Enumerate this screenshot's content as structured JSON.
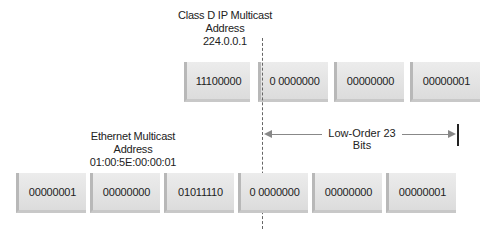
{
  "ip_address": {
    "title_line1": "Class D IP Multicast",
    "title_line2": "Address",
    "value": "224.0.0.1",
    "octets": [
      "11100000",
      "0 0000000",
      "00000000",
      "00000001"
    ]
  },
  "span": {
    "label": "Low-Order 23 Bits"
  },
  "mac_address": {
    "title_line1": "Ethernet Multicast",
    "title_line2": "Address",
    "value": "01:00:5E:00:00:01",
    "octets": [
      "00000001",
      "00000000",
      "01011110",
      "0 0000000",
      "00000000",
      "00000001"
    ]
  }
}
